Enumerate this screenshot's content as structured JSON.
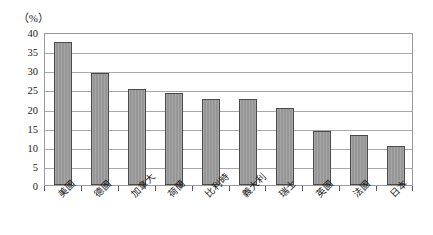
{
  "chart_data": {
    "type": "bar",
    "title": "",
    "subtitle": "",
    "xlabel": "",
    "ylabel": "（%）",
    "unit_label": "（%）",
    "ylim": [
      0,
      40
    ],
    "ytick_step": 5,
    "yticks": [
      "40",
      "35",
      "30",
      "25",
      "20",
      "15",
      "10",
      "5",
      "0"
    ],
    "grid": true,
    "legend": false,
    "legend_position": "none",
    "categories": [
      "美國",
      "德國",
      "加拿大",
      "荷蘭",
      "比利時",
      "義大利",
      "瑞士",
      "英國",
      "法國",
      "日本"
    ],
    "values": [
      37.5,
      29.2,
      25.0,
      24.0,
      22.5,
      22.5,
      20.0,
      14.2,
      13.2,
      10.3
    ],
    "series": [
      {
        "name": "",
        "values": [
          37.5,
          29.2,
          25.0,
          24.0,
          22.5,
          22.5,
          20.0,
          14.2,
          13.2,
          10.3
        ]
      }
    ],
    "bar_color": "#969696",
    "bar_border_color": "#4a4a4a",
    "gridline_color": "#a8a8a8",
    "plot_border_color": "#9a9a9a",
    "background_color": "#ffffff",
    "text_color": "#1a1a1a"
  }
}
